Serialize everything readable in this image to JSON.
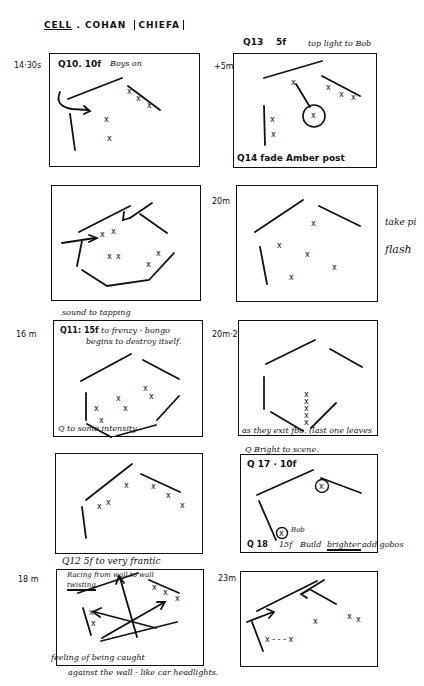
{
  "title": {
    "cell": "CELL",
    "sep": ".",
    "cohan": "COHAN",
    "chiefa": "CHIEFA"
  },
  "panels": [
    {
      "id": "p1",
      "time": "14·30s",
      "cue": "Q10. 10f",
      "note": "Boys on"
    },
    {
      "id": "p2",
      "time": "+5m",
      "cue": "Q13",
      "fade": "5f",
      "note": "top light to Bob",
      "bottom_cue": "Q14 fade Amber post"
    },
    {
      "id": "p3",
      "note": ""
    },
    {
      "id": "p4",
      "time": "20m",
      "side_note_1": "take pi",
      "side_note_2": "flash"
    },
    {
      "id": "p5",
      "time": "16 m",
      "above_note": "sound to tapping",
      "cue": "Q11: 15f",
      "note_line1": ". to frenzy - bongo",
      "note_line2": "begins to destroy itself.",
      "bottom_cue": "Q to some intensity"
    },
    {
      "id": "p6",
      "time": "20m·20f",
      "bottom_note": "as they exit  fbo. (last one leaves",
      "below_note": "Q  Bright to scene."
    },
    {
      "id": "p7",
      "note": ""
    },
    {
      "id": "p8",
      "cue": "Q 17 · 10f",
      "bob_label": "Bob",
      "bottom_cue": "Q 18",
      "bottom_fade": "15f",
      "bottom_note_1": "Build",
      "bottom_note_2": "brighter",
      "bottom_note_3": "add gobos"
    },
    {
      "id": "p9",
      "time": "18 m",
      "above_note": "Q12   5f  to very frantic",
      "note_line1": "Racing from wall to wall",
      "note_line2": "twisting",
      "bottom_note_1": "feeling of being caught",
      "bottom_note_2": "against the wall   - like car headlights."
    },
    {
      "id": "p10",
      "time": "23m"
    }
  ],
  "symbols": {
    "actor": "x",
    "arrow": "arrow",
    "wall": "line"
  }
}
